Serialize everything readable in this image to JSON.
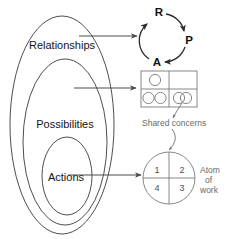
{
  "figure": {
    "title_text": "",
    "background_color": "#ffffff",
    "ink_color": "#333333"
  },
  "nested_ellipses": {
    "name": "nested-domain-ellipses",
    "levels": [
      {
        "label": "Relationships",
        "order": 1,
        "scope": "outer"
      },
      {
        "label": "Possibilities",
        "order": 2,
        "scope": "middle"
      },
      {
        "label": "Actions",
        "order": 3,
        "scope": "inner"
      }
    ]
  },
  "cycle": {
    "name": "rpa-cycle",
    "nodes": [
      {
        "key": "R",
        "label": "R",
        "position": "top"
      },
      {
        "key": "P",
        "label": "P",
        "position": "right"
      },
      {
        "key": "A",
        "label": "A",
        "position": "bottom"
      }
    ],
    "direction": "clockwise R to P to A back to R"
  },
  "grid": {
    "name": "shared-concerns-grid",
    "rows": 2,
    "columns": 2,
    "cells": [
      {
        "index": 1,
        "row": 1,
        "col": 1,
        "circles": 1,
        "overlapping": false
      },
      {
        "index": 2,
        "row": 1,
        "col": 2,
        "circles": 0,
        "overlapping": false
      },
      {
        "index": 3,
        "row": 2,
        "col": 1,
        "circles": 2,
        "overlapping": false
      },
      {
        "index": 4,
        "row": 2,
        "col": 2,
        "circles": 2,
        "overlapping": true
      }
    ],
    "caption": "Shared concerns"
  },
  "quadrant_circle": {
    "name": "atom-of-work",
    "quadrants": [
      {
        "position": "top-left",
        "label": "1"
      },
      {
        "position": "top-right",
        "label": "2"
      },
      {
        "position": "bottom-right",
        "label": "3"
      },
      {
        "position": "bottom-left",
        "label": "4"
      }
    ],
    "side_label_lines": [
      "Atom",
      "of",
      "work"
    ]
  },
  "connectors": [
    {
      "from": "Relationships",
      "to": "rpa-cycle",
      "style": "straight-arrow"
    },
    {
      "from": "Possibilities",
      "to": "shared-concerns-grid",
      "style": "straight-arrow"
    },
    {
      "from": "Actions",
      "to": "atom-of-work",
      "style": "straight-arrow"
    },
    {
      "from": "overlapping-circles-cell",
      "to": "atom-of-work",
      "style": "curved-arrow"
    }
  ]
}
